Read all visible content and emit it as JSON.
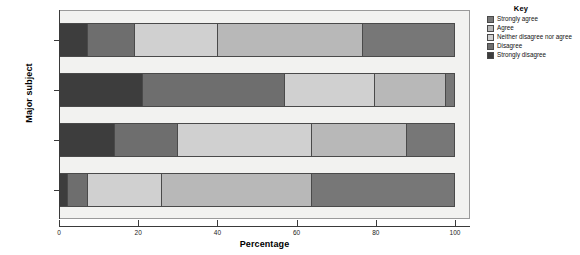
{
  "chart_data": {
    "type": "bar",
    "orientation": "horizontal",
    "stacked": true,
    "title": "",
    "xlabel": "Percentage",
    "ylabel": "Major subject",
    "xlim": [
      0,
      100
    ],
    "xticks": [
      0,
      20,
      40,
      60,
      80,
      100
    ],
    "grid": false,
    "legend_title": "Key",
    "legend_position": "right",
    "categories": [
      "Business",
      "Community Health",
      "Education",
      "Media"
    ],
    "series": [
      {
        "name": "Strongly disagree",
        "color": "#3d3d3d",
        "values": [
          7,
          21,
          14,
          2
        ]
      },
      {
        "name": "Disagree",
        "color": "#6e6e6e",
        "values": [
          12,
          36,
          16,
          5
        ]
      },
      {
        "name": "Neither disagree nor agree",
        "color": "#d0d0d0",
        "values": [
          21,
          23,
          34,
          19
        ]
      },
      {
        "name": "Agree",
        "color": "#b8b8b8",
        "values": [
          37,
          18,
          24,
          38
        ]
      },
      {
        "name": "Strongly agree",
        "color": "#777777",
        "values": [
          23,
          2,
          12,
          36
        ]
      }
    ],
    "legend_order": [
      "Strongly agree",
      "Agree",
      "Neither disagree nor agree",
      "Disagree",
      "Strongly disagree"
    ]
  },
  "axes": {
    "x_title": "Percentage",
    "y_title": "Major subject",
    "x_tick_labels": [
      "0",
      "20",
      "40",
      "60",
      "80",
      "100"
    ],
    "y_tick_labels": [
      "Business",
      "Community Health",
      "Education",
      "Media"
    ]
  },
  "legend": {
    "title": "Key",
    "items": [
      {
        "label": "Strongly agree",
        "color": "#777777"
      },
      {
        "label": "Agree",
        "color": "#b8b8b8"
      },
      {
        "label": "Neither disagree nor agree",
        "color": "#d0d0d0"
      },
      {
        "label": "Disagree",
        "color": "#6e6e6e"
      },
      {
        "label": "Strongly disagree",
        "color": "#3d3d3d"
      }
    ]
  },
  "colors": {
    "plot_background": "#f2f2f0",
    "frame": "#9a9a9a",
    "axis": "#3a3a3a",
    "segment_border": "#4a4a4a",
    "text": "#1c1c1c"
  }
}
